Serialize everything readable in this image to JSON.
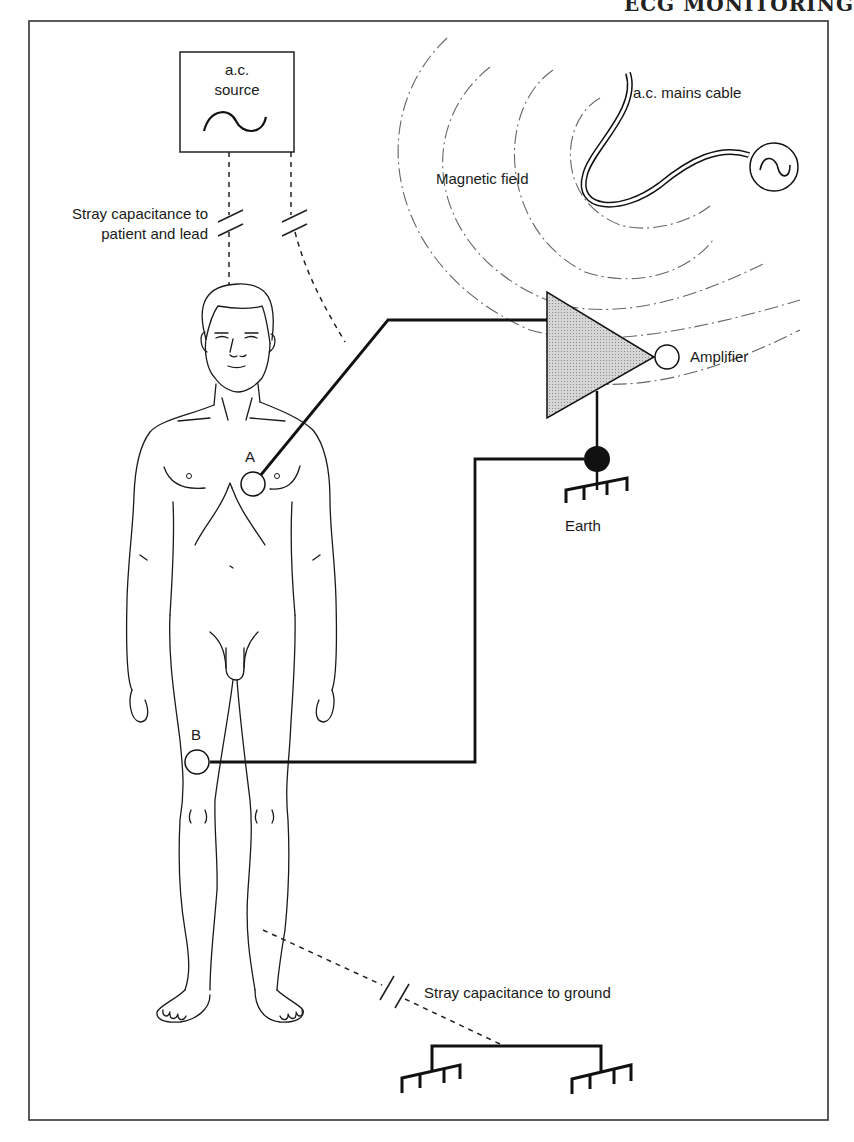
{
  "page_header": {
    "text": "ECG MONITORING"
  },
  "diagram": {
    "labels": {
      "ac_source": [
        "a.c.",
        "source"
      ],
      "stray_cap_patient": [
        "Stray capacitance to",
        "patient and lead"
      ],
      "magnetic_field": "Magnetic field",
      "mains_cable": "a.c. mains cable",
      "amplifier": "Amplifier",
      "earth": "Earth",
      "electrode_a": "A",
      "electrode_b": "B",
      "stray_cap_ground": "Stray capacitance to ground"
    },
    "nodes": [
      {
        "id": "ac-source",
        "type": "box-with-sine"
      },
      {
        "id": "patient",
        "type": "human-figure"
      },
      {
        "id": "electrode-a",
        "type": "electrode",
        "location": "chest"
      },
      {
        "id": "electrode-b",
        "type": "electrode",
        "location": "right thigh"
      },
      {
        "id": "amplifier",
        "type": "triangle-amplifier"
      },
      {
        "id": "earth",
        "type": "ground"
      },
      {
        "id": "mains-cable",
        "type": "cable-with-ac-symbol"
      },
      {
        "id": "ground-plane",
        "type": "ground-pair"
      }
    ],
    "edges": [
      {
        "from": "ac-source",
        "to": "patient",
        "style": "dashed",
        "label": "Stray capacitance to patient and lead"
      },
      {
        "from": "ac-source",
        "to": "lead-a",
        "style": "dashed"
      },
      {
        "from": "electrode-a",
        "to": "amplifier",
        "style": "solid"
      },
      {
        "from": "electrode-b",
        "to": "earth",
        "style": "solid"
      },
      {
        "from": "amplifier",
        "to": "earth",
        "style": "solid"
      },
      {
        "from": "patient",
        "to": "ground-plane",
        "style": "dashed",
        "label": "Stray capacitance to ground"
      },
      {
        "from": "mains-cable",
        "to": "amplifier",
        "style": "dash-dot",
        "label": "Magnetic field"
      }
    ],
    "colors": {
      "amplifier_fill": "#c8c8c8",
      "line": "#111111",
      "field": "#666666"
    }
  }
}
